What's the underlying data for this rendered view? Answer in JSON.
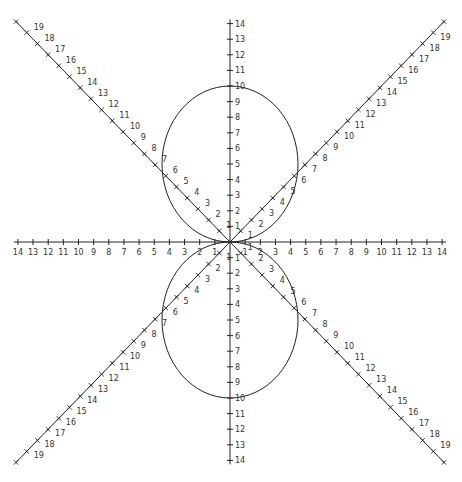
{
  "diagram": {
    "type": "polar lemniscate-like rose (two circles) on polar axes",
    "center": {
      "x": 230,
      "y": 242
    },
    "axes": {
      "horizontal": {
        "min": 14,
        "max": 14,
        "ticks": [
          1,
          2,
          3,
          4,
          5,
          6,
          7,
          8,
          9,
          10,
          11,
          12,
          13,
          14
        ]
      },
      "vertical": {
        "ticks": [
          1,
          2,
          3,
          4,
          5,
          6,
          7,
          8,
          9,
          10,
          11,
          12,
          13,
          14
        ]
      },
      "diagonals": {
        "ticks": [
          1,
          2,
          3,
          4,
          5,
          6,
          7,
          8,
          9,
          10,
          11,
          12,
          13,
          14,
          15,
          16,
          17,
          18,
          19
        ]
      }
    },
    "curves": [
      {
        "name": "upper-circle",
        "center_r": 5,
        "direction": "up",
        "diameter": 10
      },
      {
        "name": "lower-circle",
        "center_r": 5,
        "direction": "down",
        "diameter": 10
      }
    ],
    "line_color": "#222222",
    "label_color": "#333333"
  }
}
